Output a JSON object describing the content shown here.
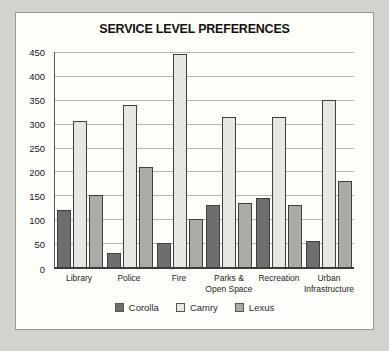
{
  "window": {
    "background_color": "#d2d2ce",
    "panel_background": "#fdfdfa",
    "panel_border_color": "#98988f"
  },
  "chart_data": {
    "type": "bar",
    "title": "SERVICE LEVEL PREFERENCES",
    "categories": [
      "Library",
      "Police",
      "Fire",
      "Parks &\nOpen Space",
      "Recreation",
      "Urban\nInfrastructure"
    ],
    "series": [
      {
        "name": "Corolla",
        "color": "#6e6e6e",
        "values": [
          120,
          30,
          50,
          130,
          145,
          55
        ]
      },
      {
        "name": "Camry",
        "color": "#e7e6e2",
        "values": [
          305,
          340,
          445,
          315,
          315,
          350
        ]
      },
      {
        "name": "Lexus",
        "color": "#abaaa6",
        "values": [
          150,
          210,
          100,
          135,
          130,
          180
        ]
      }
    ],
    "ylim": [
      0,
      450
    ],
    "yticks": [
      0,
      50,
      100,
      150,
      200,
      250,
      300,
      350,
      400,
      450
    ],
    "grid": true,
    "legend_position": "bottom",
    "xlabel": "",
    "ylabel": ""
  }
}
